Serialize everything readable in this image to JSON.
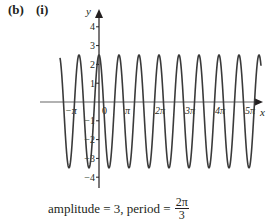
{
  "part_label": "(b)",
  "subpart_label": "(i)",
  "caption": {
    "prefix": "amplitude = 3, period =",
    "numerator": "2π",
    "denominator": "3"
  },
  "chart_data": {
    "type": "line",
    "title": "",
    "xlabel": "x",
    "ylabel": "y",
    "x_ticks": [
      "−π",
      "0",
      "π",
      "2π",
      "3π",
      "4π",
      "5π"
    ],
    "y_ticks": [
      "4",
      "3",
      "2",
      "1",
      "−1",
      "−2",
      "−3",
      "−4"
    ],
    "xlim": [
      "-1.3π",
      "5.5π"
    ],
    "ylim": [
      -4.6,
      4.6
    ],
    "grid": false,
    "legend": null,
    "series": [
      {
        "name": "y = 3cos(3x) − 0.5",
        "function": "3*cos(3x) - 0.5",
        "amplitude": 3,
        "period": "2π/3",
        "max": 2.5,
        "min": -3.5,
        "x_range": [
          "-1.3π",
          "5.4π"
        ]
      }
    ],
    "colors": {
      "curve": "#3a3a3a",
      "axis": "#555555"
    }
  }
}
